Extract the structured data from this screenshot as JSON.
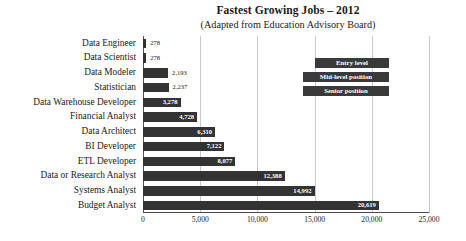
{
  "chart_data": {
    "type": "bar",
    "orientation": "horizontal",
    "title": "Fastest Growing Jobs – 2012",
    "subtitle": "(Adapted from Education Advisory Board)",
    "xlabel": "",
    "ylabel": "",
    "xlim": [
      0,
      25000
    ],
    "grid": true,
    "legend_position": "inside-top-right",
    "categories": [
      "Data Engineer",
      "Data Scientist",
      "Data Modeler",
      "Statistician",
      "Data Warehouse Developer",
      "Financial Analyst",
      "Data Architect",
      "BI Developer",
      "ETL Developer",
      "Data or Research Analyst",
      "Systems Analyst",
      "Budget Analyst"
    ],
    "values": [
      278,
      278,
      2193,
      2237,
      3278,
      4728,
      6310,
      7122,
      8077,
      12388,
      14992,
      20619
    ],
    "value_labels": [
      "278",
      "278",
      "2,193",
      "2,237",
      "3,278",
      "4,728",
      "6,310",
      "7,122",
      "8,077",
      "12,388",
      "14,992",
      "20,619"
    ],
    "xticks": [
      0,
      5000,
      10000,
      15000,
      20000,
      25000
    ],
    "xtick_labels": [
      "0",
      "5,000",
      "10,000",
      "15,000",
      "20,000",
      "25,000"
    ],
    "legend": [
      "Entry level",
      "Mid-level position",
      "Senior position"
    ],
    "bar_color": "#333333",
    "gridline_color": "#c8c8c8",
    "axis_color": "#555555",
    "label_color": "#1a1a1a",
    "inside_label_color": "#ffffff"
  }
}
